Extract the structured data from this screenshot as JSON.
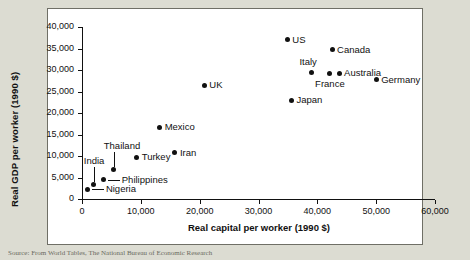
{
  "figure": {
    "caption_partial": "Source: From World Tables, The National Bureau of Economic Research"
  },
  "chart_data": {
    "type": "scatter",
    "title": "",
    "xlabel": "Real capital per worker (1990 $)",
    "ylabel": "Real GDP per worker (1990 $)",
    "xlim": [
      0,
      60000
    ],
    "ylim": [
      0,
      40000
    ],
    "xticks": [
      0,
      10000,
      20000,
      30000,
      40000,
      50000,
      60000
    ],
    "xtick_labels": [
      "0",
      "10,000",
      "20,000",
      "30,000",
      "40,000",
      "50,000",
      "60,000"
    ],
    "yticks": [
      0,
      5000,
      10000,
      15000,
      20000,
      25000,
      30000,
      35000,
      40000
    ],
    "ytick_labels": [
      "0",
      "5,000",
      "10,000",
      "15,000",
      "20,000",
      "25,000",
      "30,000",
      "35,000",
      "40,000"
    ],
    "grid": false,
    "legend": "none",
    "points": [
      {
        "label": "Nigeria",
        "x": 1000,
        "y": 2300,
        "label_pos": "leader-right"
      },
      {
        "label": "India",
        "x": 2000,
        "y": 3300,
        "label_pos": "leader-up"
      },
      {
        "label": "Philippines",
        "x": 3700,
        "y": 4500,
        "label_pos": "leader-right"
      },
      {
        "label": "Thailand",
        "x": 5400,
        "y": 6800,
        "label_pos": "leader-up"
      },
      {
        "label": "Turkey",
        "x": 9300,
        "y": 9700,
        "label_pos": "right"
      },
      {
        "label": "Mexico",
        "x": 13200,
        "y": 16700,
        "label_pos": "right"
      },
      {
        "label": "Iran",
        "x": 15800,
        "y": 10800,
        "label_pos": "right"
      },
      {
        "label": "UK",
        "x": 20800,
        "y": 26500,
        "label_pos": "right"
      },
      {
        "label": "US",
        "x": 34900,
        "y": 37000,
        "label_pos": "right"
      },
      {
        "label": "Japan",
        "x": 35600,
        "y": 23000,
        "label_pos": "right"
      },
      {
        "label": "Italy",
        "x": 39000,
        "y": 29500,
        "label_pos": "above"
      },
      {
        "label": "France",
        "x": 42000,
        "y": 29300,
        "label_pos": "below"
      },
      {
        "label": "Australia",
        "x": 43700,
        "y": 29300,
        "label_pos": "right"
      },
      {
        "label": "Canada",
        "x": 42500,
        "y": 34700,
        "label_pos": "right"
      },
      {
        "label": "Germany",
        "x": 50000,
        "y": 27700,
        "label_pos": "right"
      }
    ]
  }
}
